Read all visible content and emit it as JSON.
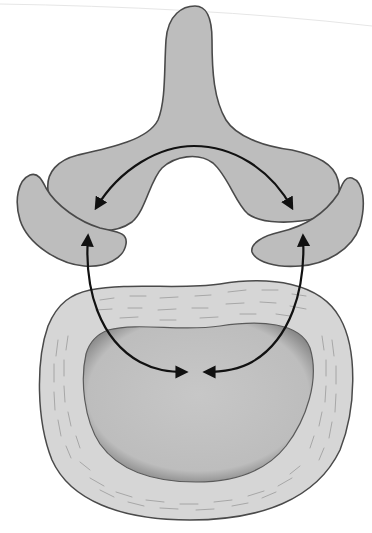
{
  "diagram": {
    "colors": {
      "background": "#ffffff",
      "bone_fill": "#bdbdbd",
      "outline": "#4a4a4a",
      "annulus_fill": "#d6d6d6",
      "fiber_stroke": "#9a9a9a",
      "nucleus_fill": "#c4c4c4",
      "nucleus_edge": "#5a5a5a",
      "arrow": "#111111",
      "scan_line": "#e6e6e6"
    },
    "parts": [
      {
        "id": "posterior-arch",
        "label": "Posterior arch with spinous process"
      },
      {
        "id": "left-facet",
        "label": "Left articular facet"
      },
      {
        "id": "right-facet",
        "label": "Right articular facet"
      },
      {
        "id": "annulus",
        "label": "Annulus fibrosus"
      },
      {
        "id": "nucleus",
        "label": "Nucleus pulposus"
      }
    ],
    "arrows": [
      {
        "id": "arch-arrow",
        "description": "Double-headed arc between left and right facets"
      },
      {
        "id": "left-arrow",
        "description": "Left facet to nucleus centre"
      },
      {
        "id": "right-arrow",
        "description": "Right facet to nucleus centre"
      }
    ]
  }
}
